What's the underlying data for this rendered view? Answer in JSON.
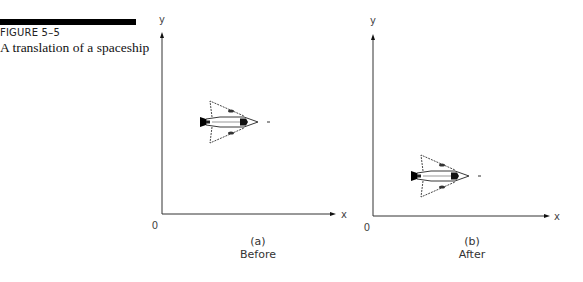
{
  "figure": {
    "label": "FIGURE 5–5",
    "title": "A translation of a spaceship"
  },
  "panels": [
    {
      "id": "a",
      "axis_x_label": "x",
      "axis_y_label": "y",
      "origin_label": "0",
      "caption_tag": "(a)",
      "caption_text": "Before",
      "object": "spaceship"
    },
    {
      "id": "b",
      "axis_x_label": "x",
      "axis_y_label": "y",
      "origin_label": "0",
      "caption_tag": "(b)",
      "caption_text": "After",
      "object": "spaceship"
    }
  ]
}
